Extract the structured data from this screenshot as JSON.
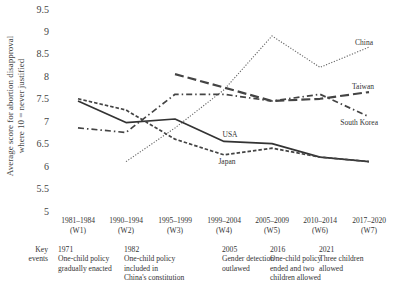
{
  "chart_data": {
    "type": "line",
    "title": "",
    "xlabel": "",
    "ylabel": "Average score for abortion disapproval where 10 = never justified",
    "ylabel_lines": [
      "Average score for abortion disapproval",
      "where 10 = never justified"
    ],
    "ylim": [
      5,
      9.5
    ],
    "yticks": [
      5,
      5.5,
      6,
      6.5,
      7,
      7.5,
      8,
      8.5,
      9,
      9.5
    ],
    "ytick_labels": [
      "5",
      "5.5",
      "6",
      "6.5",
      "7",
      "7.5",
      "8",
      "8.5",
      "9",
      "9.5"
    ],
    "grid": false,
    "categories": [
      "1981–1984 (W1)",
      "1990–1994 (W2)",
      "1995–1999 (W3)",
      "1999–2004 (W4)",
      "2005–2009 (W5)",
      "2010–2014 (W6)",
      "2017–2020 (W7)"
    ],
    "category_lines": [
      [
        "1981–1984",
        "(W1)"
      ],
      [
        "1990–1994",
        "(W2)"
      ],
      [
        "1995–1999",
        "(W3)"
      ],
      [
        "1999–2004",
        "(W4)"
      ],
      [
        "2005–2009",
        "(W5)"
      ],
      [
        "2010–2014",
        "(W6)"
      ],
      [
        "2017–2020",
        "(W7)"
      ]
    ],
    "series": [
      {
        "name": "China",
        "style": "dotted",
        "values": [
          null,
          6.1,
          6.85,
          7.7,
          8.9,
          8.2,
          8.65
        ]
      },
      {
        "name": "Taiwan",
        "style": "long-dash",
        "values": [
          null,
          null,
          8.05,
          7.75,
          7.45,
          7.5,
          7.65
        ]
      },
      {
        "name": "South Korea",
        "style": "dash-dot",
        "values": [
          6.85,
          6.75,
          7.6,
          7.6,
          7.45,
          7.6,
          7.1
        ]
      },
      {
        "name": "USA",
        "style": "solid",
        "values": [
          7.45,
          6.97,
          7.05,
          6.55,
          6.5,
          6.2,
          6.1
        ]
      },
      {
        "name": "Japan",
        "style": "short-dash",
        "values": [
          7.5,
          7.25,
          6.6,
          6.25,
          6.4,
          6.2,
          6.1
        ]
      }
    ],
    "legend": "inline-labels"
  },
  "key_events": {
    "label_lines": [
      "Key",
      "events"
    ],
    "events": [
      {
        "year": "1971",
        "lines": [
          "One-child policy",
          "gradually enacted"
        ]
      },
      {
        "year": "1982",
        "lines": [
          "One-child policy",
          "included in",
          "China's constitution"
        ]
      },
      {
        "year": "2005",
        "lines": [
          "Gender detection",
          "outlawed"
        ]
      },
      {
        "year": "2016",
        "lines": [
          "One-child policy",
          "ended and two",
          "children allowed"
        ]
      },
      {
        "year": "2021",
        "lines": [
          "Three children",
          "allowed"
        ]
      }
    ]
  }
}
